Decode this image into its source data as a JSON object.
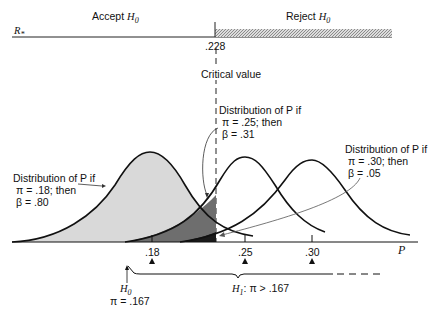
{
  "header": {
    "accept_label": "Accept",
    "reject_label": "Reject",
    "h0_symbol": "H",
    "h0_sub": "0",
    "axis_symbol": "R",
    "axis_sub": "*",
    "critical_value": ".228",
    "critical_label": "Critical value"
  },
  "annotations": {
    "dist18": [
      "Distribution of P if",
      "π = .18; then",
      "β = .80"
    ],
    "dist25": [
      "Distribution of P if",
      "π = .25; then",
      "β = .31"
    ],
    "dist30": [
      "Distribution of P if",
      "π = .30; then",
      "β = .05"
    ]
  },
  "axis": {
    "label": "P",
    "ticks": [
      ".18",
      ".25",
      ".30"
    ]
  },
  "hypotheses": {
    "h0_label": "H",
    "h0_sub": "0",
    "h0_value": "π = .167",
    "h1_label": "H",
    "h1_sub": "1",
    "h1_value": ": π > .167"
  },
  "colors": {
    "light_fill": "#d9d9d9",
    "mid_fill": "#6e6e6e",
    "dark_fill": "#1a1a1a"
  }
}
